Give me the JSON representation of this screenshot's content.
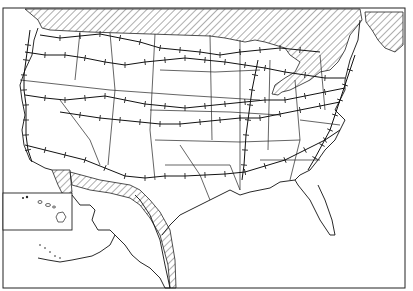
{
  "map": {
    "title": "",
    "description": "Black-and-white outline map of the United States with state boundaries, transcontinental railroad lines shown as tick-marked lines, hatched Canada and Mexico, and inset maps of Alaska and Hawaii",
    "colors": {
      "background": "#ffffff",
      "lines": "#111111",
      "hatch": "#333333"
    },
    "regions": {
      "canada": "hatched",
      "mexico": "hatched",
      "hawaii_inset": "boxed inset",
      "alaska_inset": "unboxed inset with hatched Canada border strip"
    },
    "legend": {
      "railroad_symbol": "line with cross ticks"
    }
  }
}
